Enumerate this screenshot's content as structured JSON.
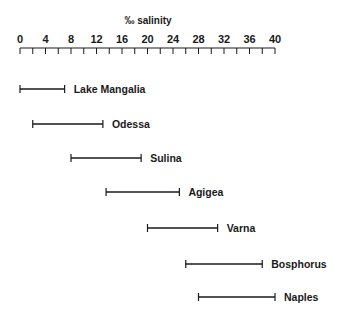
{
  "chart_data": {
    "type": "range-bar",
    "title": "‰ salinity",
    "xlabel": "‰ salinity",
    "ylabel": "",
    "xlim": [
      0,
      40
    ],
    "x_ticks_labeled": [
      0,
      4,
      8,
      12,
      16,
      20,
      24,
      28,
      32,
      36,
      40
    ],
    "x_minor_tick_step": 2,
    "axis_position": "top",
    "grid": false,
    "legend": null,
    "categories": [
      "Lake Mangalia",
      "Odessa",
      "Sulina",
      "Agigea",
      "Varna",
      "Bosphorus",
      "Naples"
    ],
    "series": [
      {
        "name": "salinity range",
        "ranges": [
          {
            "label": "Lake Mangalia",
            "min": 0,
            "max": 7
          },
          {
            "label": "Odessa",
            "min": 2,
            "max": 13
          },
          {
            "label": "Sulina",
            "min": 8,
            "max": 19
          },
          {
            "label": "Agigea",
            "min": 13.5,
            "max": 25
          },
          {
            "label": "Varna",
            "min": 20,
            "max": 31
          },
          {
            "label": "Bosphorus",
            "min": 26,
            "max": 38
          },
          {
            "label": "Naples",
            "min": 28,
            "max": 40
          }
        ]
      }
    ]
  },
  "layout": {
    "axis_x0_px": 20,
    "axis_x40_px": 275,
    "axis_y_px": 48,
    "row_y_px": [
      89,
      124,
      158,
      192,
      228,
      264,
      297
    ]
  },
  "colors": {
    "line": "#1a1a1a",
    "background": "#ffffff"
  }
}
